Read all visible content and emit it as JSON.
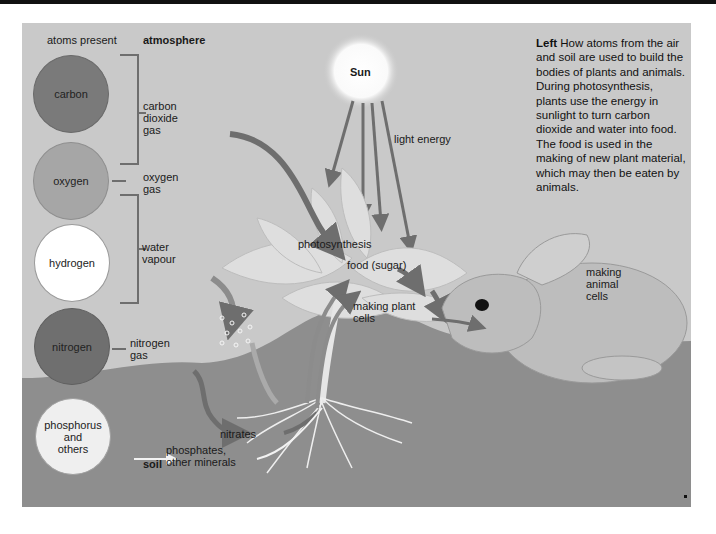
{
  "headers": {
    "atoms_present": "atoms present",
    "atmosphere": "atmosphere",
    "soil": "soil"
  },
  "atoms": [
    {
      "name": "carbon",
      "color": "#7a7a7a"
    },
    {
      "name": "oxygen",
      "color": "#a6a6a6"
    },
    {
      "name": "hydrogen",
      "color": "#ffffff"
    },
    {
      "name": "nitrogen",
      "color": "#6f6f6f"
    },
    {
      "name": "phosphorus\nand\nothers",
      "color": "#efefef"
    }
  ],
  "gases": {
    "carbon_dioxide": "carbon\ndioxide\ngas",
    "oxygen": "oxygen\ngas",
    "water_vapour": "water\nvapour",
    "nitrogen": "nitrogen\ngas"
  },
  "soil_labels": {
    "nitrates": "nitrates",
    "phosphates": "phosphates,\nother minerals"
  },
  "sun": {
    "label": "Sun",
    "light_energy": "light energy"
  },
  "plant": {
    "photosynthesis": "photosynthesis",
    "food": "food (sugar)",
    "making_plant_cells": "making plant\ncells"
  },
  "animal": {
    "making_animal_cells": "making\nanimal\ncells"
  },
  "caption": {
    "lead": "Left",
    "text": " How atoms from the air and soil are used to build the bodies of plants and animals. During photosynthesis, plants use the energy in sunlight to turn carbon dioxide and water into food. The food is used in the making of new plant material, which may then be eaten by animals."
  },
  "colors": {
    "sky": "#c9c9c9",
    "soil": "#8e8e8e",
    "arrow": "#6e6e6e",
    "leaf": "#dcdcdc"
  }
}
